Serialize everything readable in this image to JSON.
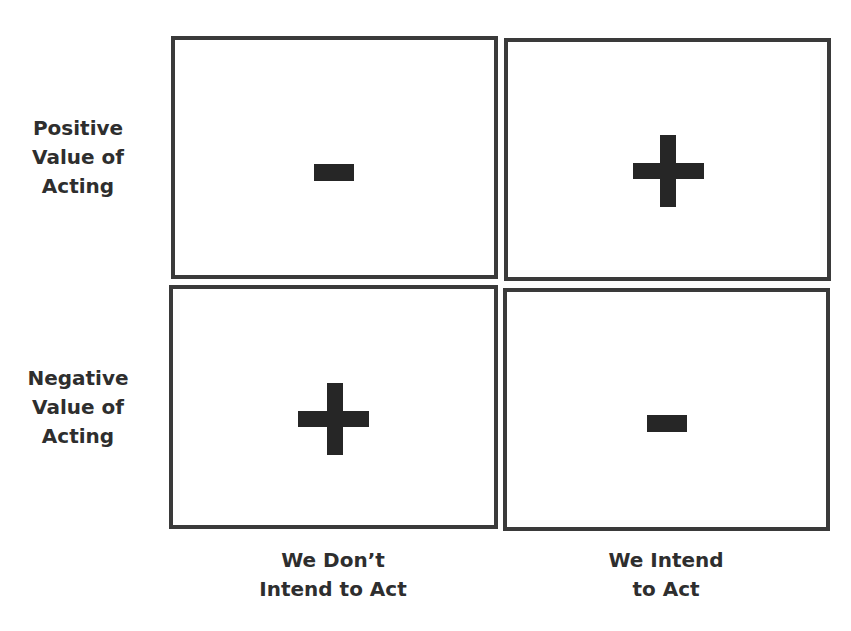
{
  "diagram": {
    "type": "2x2 matrix",
    "row_labels": [
      {
        "lines": [
          "Positive",
          "Value of",
          "Acting"
        ]
      },
      {
        "lines": [
          "Negative",
          "Value of",
          "Acting"
        ]
      }
    ],
    "column_labels": [
      {
        "lines": [
          "We Don’t",
          "Intend to Act"
        ]
      },
      {
        "lines": [
          "We Intend",
          "to Act"
        ]
      }
    ],
    "cells": [
      {
        "row": "Positive Value of Acting",
        "column": "We Don’t Intend to Act",
        "symbol": "minus",
        "meaning": "-"
      },
      {
        "row": "Positive Value of Acting",
        "column": "We Intend to Act",
        "symbol": "plus",
        "meaning": "+"
      },
      {
        "row": "Negative Value of Acting",
        "column": "We Don’t Intend to Act",
        "symbol": "plus",
        "meaning": "+"
      },
      {
        "row": "Negative Value of Acting",
        "column": "We Intend to Act",
        "symbol": "minus",
        "meaning": "-"
      }
    ],
    "colors": {
      "border": "#3a3a3a",
      "symbol": "#262626",
      "text": "#2e2e2e",
      "background": "#ffffff"
    }
  }
}
